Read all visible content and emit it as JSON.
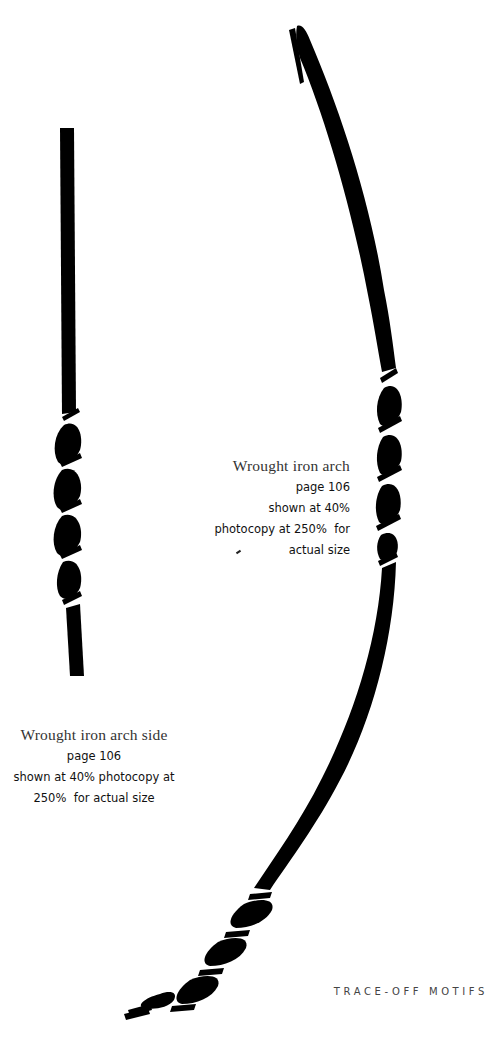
{
  "page": {
    "background": "#ffffff",
    "ink_color": "#000000"
  },
  "motifs": [
    {
      "id": "arch-side",
      "icon": "wrought-iron-bar-icon",
      "description": "straight vertical bar with twisted section"
    },
    {
      "id": "arch",
      "icon": "wrought-iron-arch-icon",
      "description": "curved arch bar with two twisted sections"
    }
  ],
  "captions": {
    "arch": {
      "title": "Wrought iron arch",
      "lines": [
        "page 106",
        "shown at 40%",
        "photocopy at 250%  for",
        "actual size"
      ]
    },
    "arch_side": {
      "title": "Wrought iron arch side",
      "lines": [
        "page 106",
        "shown at 40% photocopy at",
        "250%  for actual size"
      ]
    }
  },
  "footer": {
    "label": "TRACE-OFF MOTIFS"
  }
}
